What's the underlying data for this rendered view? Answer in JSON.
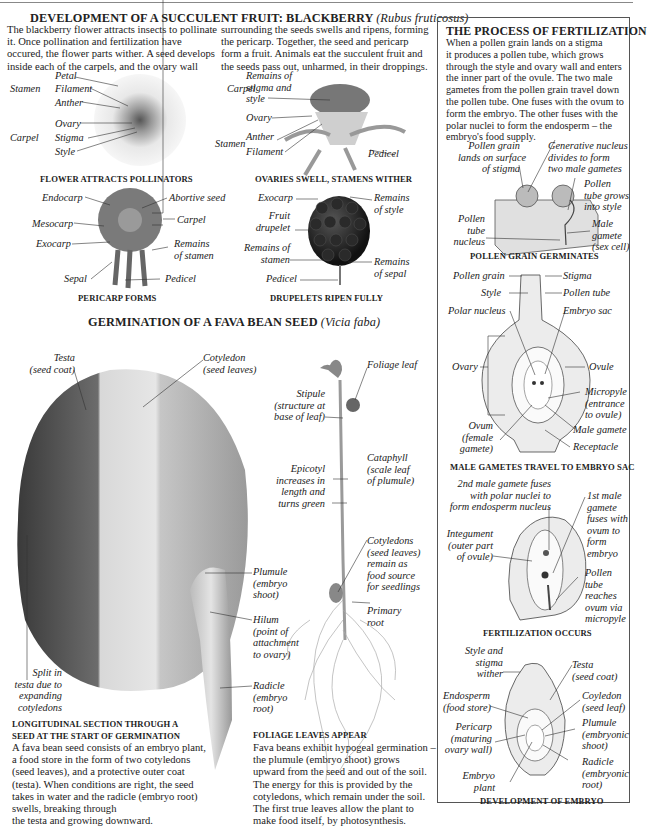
{
  "blackberry": {
    "title": "DEVELOPMENT OF A SUCCULENT FRUIT: BLACKBERRY",
    "title_species": "(Rubus fruticosus)",
    "intro_col1": [
      "The blackberry flower attracts insects to pollinate",
      "it. Once pollination and fertilization have",
      "occured, the flower parts wither. A seed develops",
      "inside each of the carpels, and the ovary wall"
    ],
    "intro_col2": [
      "surrounding the seeds swells and ripens, forming",
      "the pericarp. Together, the seed and pericarp",
      "form a fruit. Animals eat the succulent fruit and",
      "the seeds pass out, unharmed, in their droppings."
    ],
    "flower": {
      "caption": "FLOWER ATTRACTS POLLINATORS",
      "labels": {
        "stamen": "Stamen",
        "petal": "Petal",
        "filament": "Filament",
        "anther": "Anther",
        "carpel": "Carpel",
        "ovary": "Ovary",
        "stigma": "Stigma",
        "style": "Style"
      }
    },
    "ovaries": {
      "caption": "OVARIES SWELL, STAMENS WITHER",
      "labels": {
        "carpel": "Carpel",
        "remains1": "Remains of",
        "remains2": "stigma and",
        "remains3": "style",
        "ovary": "Ovary",
        "stamen": "Stamen",
        "anther": "Anther",
        "filament": "Filament",
        "pedicel": "Pedicel"
      }
    },
    "pericarp": {
      "caption": "PERICARP FORMS",
      "labels": {
        "endocarp": "Endocarp",
        "mesocarp": "Mesocarp",
        "exocarp": "Exocarp",
        "sepal": "Sepal",
        "abortive": "Abortive seed",
        "carpel": "Carpel",
        "remains1": "Remains",
        "remains2": "of stamen",
        "pedicel": "Pedicel"
      }
    },
    "drupelets": {
      "caption": "DRUPELETS RIPEN FULLY",
      "labels": {
        "exocarp": "Exocarp",
        "fruit1": "Fruit",
        "fruit2": "drupelet",
        "rs1": "Remains of",
        "rs2": "stamen",
        "pedicel": "Pedicel",
        "rst1": "Remains",
        "rst2": "of style",
        "rse1": "Remains",
        "rse2": "of sepal"
      }
    }
  },
  "germination": {
    "title": "GERMINATION OF A FAVA BEAN SEED",
    "title_species": "(Vicia faba)",
    "seed_labels": {
      "testa1": "Testa",
      "testa2": "(seed coat)",
      "coty1": "Cotyledon",
      "coty2": "(seed leaves)",
      "plumule1": "Plumule",
      "plumule2": "(embryo",
      "plumule3": "shoot)",
      "hilum1": "Hilum",
      "hilum2": "(point of",
      "hilum3": "attachment",
      "hilum4": "to ovary)",
      "radicle1": "Radicle",
      "radicle2": "(embryo",
      "radicle3": "root)",
      "split1": "Split in",
      "split2": "testa due to",
      "split3": "expanding",
      "split4": "cotyledons"
    },
    "seedling_labels": {
      "foliage": "Foliage leaf",
      "stipule1": "Stipule",
      "stipule2": "(structure at",
      "stipule3": "base of leaf)",
      "cata1": "Cataphyll",
      "cata2": "(scale leaf",
      "cata3": "of plumule)",
      "epi1": "Epicotyl",
      "epi2": "increases in",
      "epi3": "length and",
      "epi4": "turns green",
      "cots1": "Cotyledons",
      "cots2": "(seed leaves)",
      "cots3": "remain as",
      "cots4": "food source",
      "cots5": "for seedlings",
      "primary1": "Primary",
      "primary2": "root"
    },
    "section": {
      "caption1": "LONGITUDINAL SECTION THROUGH A",
      "caption2": "SEED AT THE START OF GERMINATION",
      "text": [
        "A fava bean seed consists of an embryo plant,",
        "a food store in the form of two cotyledons",
        "(seed leaves), and a protective outer coat",
        "(testa). When conditions are right, the seed",
        "takes in water and the radicle (embryo root)",
        "swells, breaking through",
        "the testa and growing downward."
      ]
    },
    "foliage": {
      "caption": "FOLIAGE LEAVES APPEAR",
      "text": [
        "Fava beans exhibit hypogeal germination –",
        "the plumule (embryo shoot) grows",
        "upward from the seed and out of the soil.",
        "The energy for this is provided by the",
        "cotyledons, which remain under the soil.",
        "The first true leaves allow the plant to",
        "make food itself, by photosynthesis."
      ]
    }
  },
  "fertilization": {
    "title": "THE PROCESS OF FERTILIZATION",
    "text": [
      "When a pollen grain lands on a stigma",
      "it produces a pollen tube, which grows",
      "through the style and ovary wall and enters",
      "the inner part of the ovule. The two male",
      "gametes from the pollen grain travel down",
      "the pollen tube. One fuses with the ovum to",
      "form the embryo. The other fuses with the",
      "polar nuclei to form the endosperm – the",
      "embryo's food supply."
    ],
    "pollen": {
      "caption": "POLLEN GRAIN  GERMINATES",
      "labels": {
        "pg1": "Pollen grain",
        "pg2": "lands on surface",
        "pg3": "of stigma",
        "gn1": "Generative nucleus",
        "gn2": "divides to form",
        "gn3": "two male gametes",
        "pt1": "Pollen",
        "pt2": "tube grows",
        "pt3": "into style",
        "ptn1": "Pollen",
        "ptn2": "tube",
        "ptn3": "nucleus",
        "mg1": "Male",
        "mg2": "gamete",
        "mg3": "(sex cell)"
      }
    },
    "travel": {
      "caption": "MALE GAMETES TRAVEL TO EMBRYO SAC",
      "labels": {
        "pollen_grain": "Pollen grain",
        "stigma": "Stigma",
        "style": "Style",
        "pollen_tube": "Pollen tube",
        "polar": "Polar nucleus",
        "sac": "Embryo sac",
        "ovary": "Ovary",
        "ovule": "Ovule",
        "mic1": "Micropyle",
        "mic2": "(entrance",
        "mic3": "to ovule)",
        "ovum1": "Ovum",
        "ovum2": "(female",
        "ovum3": "gamete)",
        "male": "Male gamete",
        "receptacle": "Receptacle"
      }
    },
    "occurs": {
      "caption": "FERTILIZATION OCCURS",
      "labels": {
        "sec1": "2nd male gamete fuses",
        "sec2": "with polar nuclei to",
        "sec3": "form endosperm nucleus",
        "first1": "1st male",
        "first2": "gamete",
        "first3": "fuses with",
        "first4": "ovum to",
        "first5": "form",
        "first6": "embryo",
        "int1": "Integument",
        "int2": "(outer part",
        "int3": "of ovule)",
        "pt1": "Pollen",
        "pt2": "tube",
        "pt3": "reaches",
        "pt4": "ovum via",
        "pt5": "micropyle"
      }
    },
    "embryo": {
      "caption": "DEVELOPMENT OF EMBRYO",
      "labels": {
        "sas1": "Style and",
        "sas2": "stigma",
        "sas3": "wither",
        "testa1": "Testa",
        "testa2": "(seed coat)",
        "endo1": "Endosperm",
        "endo2": "(food store)",
        "coy1": "Coyledon",
        "coy2": "(seed leaf)",
        "peri1": "Pericarp",
        "peri2": "(maturing",
        "peri3": "ovary wall)",
        "plum1": "Plumule",
        "plum2": "(embryonic",
        "plum3": "shoot)",
        "rad1": "Radicle",
        "rad2": "(embryonic",
        "rad3": "root)",
        "emb1": "Embryo",
        "emb2": "plant"
      }
    }
  }
}
